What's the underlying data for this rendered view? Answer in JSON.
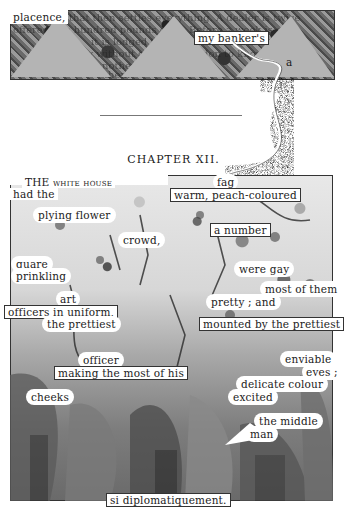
{
  "top_band": {
    "labels": {
      "placence": "placence,",
      "banker": "my banker's",
      "a": "a"
    },
    "ghost_lines": [
      "that then settles everything. A dealer is twice",
      "offered five hundred pounds on it. Before a week is over",
      "it is lodged that settle",
      "by without going to London to know",
      "another m",
      "them"
    ]
  },
  "chapter": {
    "title": "CHAPTER XII."
  },
  "main_art": {
    "labels": {
      "the_white_house": "THE white house",
      "had_the": "had the",
      "fag": "fag",
      "warm_peach": "warm, peach-coloured",
      "plying_flower": "plying flower",
      "crowd": "crowd,",
      "a_number": "a number",
      "quare": "quare",
      "prinkling": "prinkling",
      "were_gay": "were gay",
      "most_of_them": "most of them",
      "pretty_and": "pretty ; and",
      "art": "art",
      "officers_in_uniform": "officers in uniform,",
      "the_prettiest": "the prettiest",
      "mounted_by": "mounted by the prettiest",
      "officer": "officer",
      "making_the_most": "making the most of his",
      "enviable": "enviable",
      "eyes": "eyes ;",
      "delicate_colour": "delicate colour",
      "excited": "excited",
      "cheeks": "cheeks",
      "the_middle": "the middle",
      "man": "man",
      "si_diplomatiquement": "si diplomatiquement."
    }
  },
  "colors": {
    "paper": "#ffffff",
    "ink": "#1b1b1b",
    "triangle_gray": "#b4b4b4",
    "frame": "#333333"
  }
}
